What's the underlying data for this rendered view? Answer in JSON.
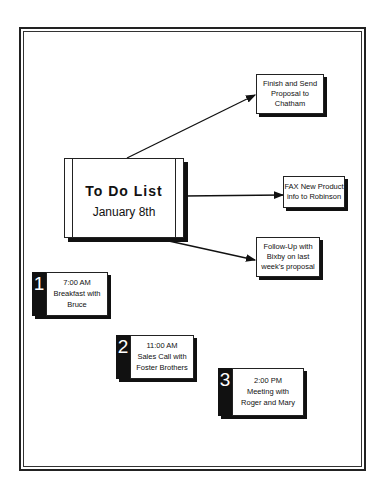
{
  "title": {
    "heading": "To Do List",
    "date": "January 8th"
  },
  "tasks": [
    {
      "lines": [
        "Finish and Send",
        "Proposal to",
        "Chatham"
      ]
    },
    {
      "lines": [
        "FAX New Product",
        "info to Robinson"
      ]
    },
    {
      "lines": [
        "Follow-Up with",
        "Bixby on last",
        "week's proposal"
      ]
    }
  ],
  "appointments": [
    {
      "number": "1",
      "time": "7:00  AM",
      "lines": [
        "Breakfast with",
        "Bruce"
      ]
    },
    {
      "number": "2",
      "time": "11:00  AM",
      "lines": [
        "Sales Call with",
        "Foster Brothers"
      ]
    },
    {
      "number": "3",
      "time": "2:00  PM",
      "lines": [
        "Meeting with",
        "Roger and Mary"
      ]
    }
  ]
}
